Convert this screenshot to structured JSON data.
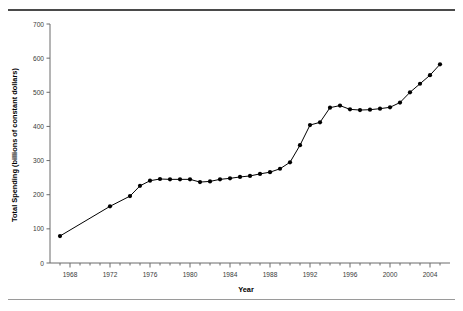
{
  "figure": {
    "background_color": "#ffffff",
    "rule_top_color": "#4a4a4a",
    "rule_bottom_color": "#9a9a9a"
  },
  "chart_data": {
    "type": "line",
    "title": "",
    "xlabel": "Year",
    "ylabel": "Total Spending (billions of constant dollars)",
    "xlim": [
      1966,
      2006
    ],
    "ylim": [
      0,
      700
    ],
    "grid": false,
    "legend": null,
    "line_color": "#000000",
    "marker": "filled-circle",
    "marker_color": "#000000",
    "xticks_major": [
      1968,
      1972,
      1976,
      1980,
      1984,
      1988,
      1992,
      1996,
      2000,
      2004
    ],
    "xtick_labels": [
      "1968",
      "1972",
      "1976",
      "1980",
      "1984",
      "1988",
      "1992",
      "1996",
      "2000",
      "2004"
    ],
    "xtick_minor_step": 1,
    "yticks": [
      0,
      100,
      200,
      300,
      400,
      500,
      600,
      700
    ],
    "ytick_labels": [
      "0",
      "100",
      "200",
      "300",
      "400",
      "500",
      "600",
      "700"
    ],
    "x": [
      1967,
      1972,
      1974,
      1975,
      1976,
      1977,
      1978,
      1979,
      1980,
      1981,
      1982,
      1983,
      1984,
      1985,
      1986,
      1987,
      1988,
      1989,
      1990,
      1991,
      1992,
      1993,
      1994,
      1995,
      1996,
      1997,
      1998,
      1999,
      2000,
      2001,
      2002,
      2003,
      2004,
      2005
    ],
    "values": [
      79,
      166,
      196,
      226,
      241,
      246,
      245,
      245,
      245,
      237,
      239,
      245,
      248,
      252,
      255,
      261,
      266,
      276,
      295,
      345,
      404,
      412,
      455,
      461,
      450,
      448,
      449,
      452,
      456,
      470,
      500,
      525,
      550,
      582
    ],
    "series": [
      {
        "name": "Total Spending",
        "points": [
          {
            "year": 1967,
            "value": 79
          },
          {
            "year": 1972,
            "value": 166
          },
          {
            "year": 1974,
            "value": 196
          },
          {
            "year": 1975,
            "value": 226
          },
          {
            "year": 1976,
            "value": 241
          },
          {
            "year": 1977,
            "value": 246
          },
          {
            "year": 1978,
            "value": 245
          },
          {
            "year": 1979,
            "value": 245
          },
          {
            "year": 1980,
            "value": 245
          },
          {
            "year": 1981,
            "value": 237
          },
          {
            "year": 1982,
            "value": 239
          },
          {
            "year": 1983,
            "value": 245
          },
          {
            "year": 1984,
            "value": 248
          },
          {
            "year": 1985,
            "value": 252
          },
          {
            "year": 1986,
            "value": 255
          },
          {
            "year": 1987,
            "value": 261
          },
          {
            "year": 1988,
            "value": 266
          },
          {
            "year": 1989,
            "value": 276
          },
          {
            "year": 1990,
            "value": 295
          },
          {
            "year": 1991,
            "value": 345
          },
          {
            "year": 1992,
            "value": 404
          },
          {
            "year": 1993,
            "value": 412
          },
          {
            "year": 1994,
            "value": 455
          },
          {
            "year": 1995,
            "value": 461
          },
          {
            "year": 1996,
            "value": 450
          },
          {
            "year": 1997,
            "value": 448
          },
          {
            "year": 1998,
            "value": 449
          },
          {
            "year": 1999,
            "value": 452
          },
          {
            "year": 2000,
            "value": 456
          },
          {
            "year": 2001,
            "value": 470
          },
          {
            "year": 2002,
            "value": 500
          },
          {
            "year": 2003,
            "value": 525
          },
          {
            "year": 2004,
            "value": 550
          },
          {
            "year": 2005,
            "value": 582
          }
        ]
      }
    ]
  }
}
